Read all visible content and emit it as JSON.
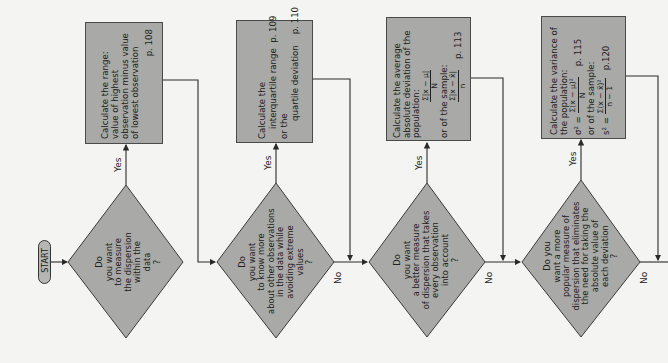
{
  "orientation": "rotated-90-ccw",
  "colors": {
    "shape_fill": "#a9a9a7",
    "line": "#2a2a2a",
    "background": "#f4f4f2"
  },
  "start": {
    "label": "START"
  },
  "decisions": [
    {
      "id": "d1",
      "lines": [
        "Do",
        "you want",
        "to measure",
        "the dispersion",
        "within the",
        "data",
        "?"
      ],
      "yes_label": "Yes",
      "no_label": ""
    },
    {
      "id": "d2",
      "lines": [
        "Do",
        "you want",
        "to know more",
        "about other observations",
        "in the data while",
        "avoiding extreme",
        "values",
        "?"
      ],
      "yes_label": "Yes",
      "no_label": "No"
    },
    {
      "id": "d3",
      "lines": [
        "Do",
        "you want",
        "a better measure",
        "of dispersion that takes",
        "every observation",
        "into account",
        "?"
      ],
      "yes_label": "Yes",
      "no_label": "No"
    },
    {
      "id": "d4",
      "lines": [
        "Do you",
        "want a more",
        "popular measure of",
        "dispersion that eliminates",
        "the need for taking the",
        "absolute value of",
        "each deviation",
        "?"
      ],
      "yes_label": "Yes",
      "no_label": "No"
    }
  ],
  "actions": [
    {
      "id": "a1",
      "lines": [
        "Calculate the range:",
        "value of highest",
        "observation minus value",
        "of lowest observation"
      ],
      "page": "p. 108"
    },
    {
      "id": "a2",
      "title": "Calculate the",
      "item1": "interquartile range",
      "page1": "p. 109",
      "connector": "or the",
      "item2": "quartile deviation",
      "page2": "p. 110"
    },
    {
      "id": "a3",
      "lines": [
        "Calculate the average",
        "absolute deviation of the",
        "population:"
      ],
      "pop_num": "Σ|x − μ|",
      "pop_den": "N",
      "sample_label": "or of the sample:",
      "sample_num": "Σ|x − x̄|",
      "sample_den": "n",
      "page": "p. 113"
    },
    {
      "id": "a4",
      "lines": [
        "Calculate the variance of",
        "the population:"
      ],
      "pop_lhs": "σ² =",
      "pop_num": "Σ(x − μ)²",
      "pop_den": "N",
      "page1": "p. 115",
      "sample_label": "or of the sample:",
      "sample_lhs": "s² =",
      "sample_num": "Σ(x − x̄)²",
      "sample_den": "n − 1",
      "page2": "p.120"
    }
  ]
}
